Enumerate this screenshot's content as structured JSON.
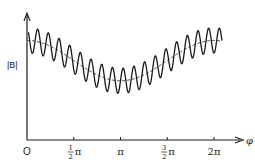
{
  "chart_data": {
    "type": "line",
    "title": "",
    "xlabel": "φ",
    "ylabel": "|B|",
    "xlim": [
      0,
      7.0
    ],
    "ylim": [
      0,
      1.0
    ],
    "grid": false,
    "legend": "none",
    "x_ticks": [
      {
        "value": 0,
        "label": "O"
      },
      {
        "value": 1.5708,
        "label_num": "1",
        "label_den": "2",
        "label_suffix": "π"
      },
      {
        "value": 3.1416,
        "label": "π"
      },
      {
        "value": 4.7124,
        "label_num": "3",
        "label_den": "2",
        "label_suffix": "π"
      },
      {
        "value": 6.2832,
        "label": "2π"
      }
    ],
    "series": [
      {
        "name": "|B| (rippled)",
        "style": "solid",
        "function": "mean(φ) + amplitude·cos(N·φ)",
        "mean_offset": 0.63,
        "mean_cos_amplitude": 0.16,
        "ripple_amplitude": 0.1,
        "ripple_periods_per_2pi": 17.5,
        "phi_range": [
          0.05,
          6.55
        ]
      },
      {
        "name": "mean |B|",
        "style": "dashed",
        "function": "offset + a·cos(φ)",
        "mean_offset": 0.63,
        "mean_cos_amplitude": 0.16,
        "phi_range": [
          0.0,
          6.55
        ]
      }
    ]
  }
}
